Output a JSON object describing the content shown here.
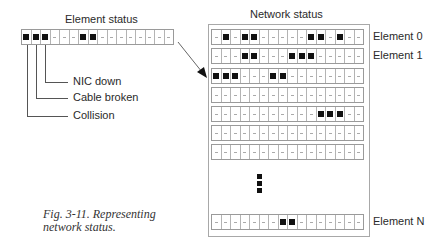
{
  "figure": {
    "caption_line1": "Fig. 3-11. Representing",
    "caption_line2": "network status."
  },
  "element_status": {
    "title": "Element status",
    "bits": [
      1,
      1,
      1,
      0,
      0,
      0,
      1,
      1,
      0,
      0,
      0,
      0,
      0,
      0,
      0,
      0
    ],
    "callouts": [
      {
        "label": "NIC down",
        "bit_index": 2
      },
      {
        "label": "Cable broken",
        "bit_index": 1
      },
      {
        "label": "Collision",
        "bit_index": 0
      }
    ]
  },
  "network_status": {
    "title": "Network status",
    "rows": [
      {
        "label": "Element 0",
        "bits": [
          0,
          1,
          0,
          1,
          1,
          0,
          0,
          0,
          0,
          0,
          1,
          1,
          0,
          1,
          0,
          0
        ]
      },
      {
        "label": "Element 1",
        "bits": [
          0,
          0,
          0,
          1,
          1,
          0,
          0,
          0,
          1,
          1,
          1,
          0,
          0,
          0,
          0,
          0
        ]
      },
      {
        "label": "",
        "bits": [
          1,
          1,
          1,
          0,
          0,
          0,
          1,
          1,
          0,
          0,
          0,
          0,
          0,
          0,
          0,
          0
        ]
      },
      {
        "label": "",
        "bits": [
          0,
          0,
          0,
          0,
          0,
          0,
          0,
          0,
          0,
          0,
          0,
          0,
          0,
          0,
          0,
          0
        ]
      },
      {
        "label": "",
        "bits": [
          0,
          0,
          0,
          0,
          0,
          0,
          0,
          0,
          0,
          0,
          0,
          1,
          1,
          1,
          0,
          0
        ]
      },
      {
        "label": "",
        "bits": [
          0,
          0,
          0,
          0,
          0,
          0,
          0,
          0,
          0,
          0,
          0,
          0,
          0,
          0,
          0,
          0
        ]
      },
      {
        "label": "",
        "bits": [
          0,
          0,
          0,
          0,
          0,
          0,
          0,
          0,
          0,
          0,
          0,
          0,
          0,
          0,
          0,
          0
        ]
      }
    ],
    "ellipsis": "vertical-ellipsis",
    "last_row": {
      "label": "Element N",
      "bits": [
        0,
        0,
        0,
        0,
        0,
        0,
        0,
        1,
        1,
        0,
        0,
        0,
        0,
        0,
        0,
        0
      ]
    }
  },
  "colors": {
    "bit_on": "#111111",
    "grid_line": "#b4b4b4",
    "background": "#ffffff"
  }
}
